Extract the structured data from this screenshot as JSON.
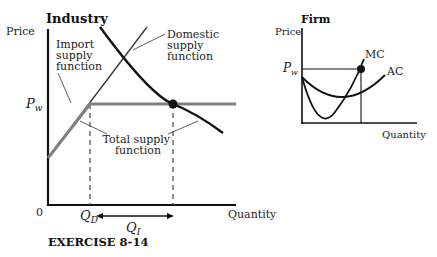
{
  "industry": {
    "title": "Industry",
    "y_axis_label": "Price",
    "x_axis_label": "Quantity",
    "origin_label": "0",
    "pw_label": "P",
    "pw_sub": "w",
    "qd_label": "Q",
    "qd_sub": "D",
    "qi_label": "Q",
    "qi_sub": "I",
    "import_label": [
      "Import",
      "supply",
      "function"
    ],
    "domestic_label": [
      "Domestic",
      "supply",
      "function"
    ],
    "total_label": [
      "Total supply",
      "function"
    ]
  },
  "firm": {
    "title": "Firm",
    "y_axis_label": "Price",
    "x_axis_label": "Quantity",
    "pw_label": "P",
    "pw_sub": "w",
    "mc_label": "MC",
    "ac_label": "AC"
  },
  "caption": "EXERCISE 8-14",
  "colors": {
    "axis": "#111111",
    "demand": "#111111",
    "total_supply": "#808080",
    "domestic_supply": "#333333"
  }
}
